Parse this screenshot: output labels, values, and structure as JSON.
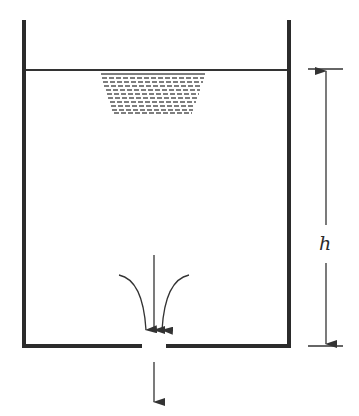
{
  "diagram": {
    "labels": {
      "height": "h"
    },
    "colors": {
      "wall": "#2b2b2b",
      "line": "#333333",
      "hatch": "#555555",
      "background": "#ffffff"
    },
    "elements": [
      "tank-left-wall",
      "tank-right-wall",
      "tank-bottom-left",
      "tank-bottom-right",
      "orifice-gap",
      "free-surface-line",
      "water-surface-hatch",
      "flow-arrows-converging",
      "outflow-arrow",
      "height-dimension-arrow"
    ]
  }
}
